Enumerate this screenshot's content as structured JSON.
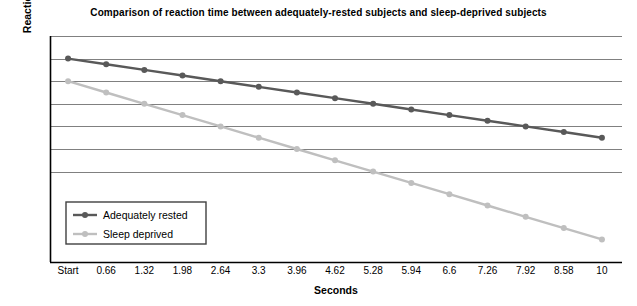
{
  "chart_data": {
    "type": "line",
    "title": "Comparison of reaction time between adequately-rested subjects and sleep-deprived subjects",
    "xlabel": "Seconds",
    "ylabel": "Reaction time   < Slower   Faster >",
    "categories": [
      "Start",
      "0.66",
      "1.32",
      "1.98",
      "2.64",
      "3.3",
      "3.96",
      "4.62",
      "5.28",
      "5.94",
      "6.6",
      "7.26",
      "7.92",
      "8.58",
      "10"
    ],
    "series": [
      {
        "name": "Adequately rested",
        "color": "#595959",
        "values": [
          10.0,
          9.75,
          9.5,
          9.25,
          9.0,
          8.75,
          8.5,
          8.25,
          8.0,
          7.75,
          7.5,
          7.25,
          7.0,
          6.75,
          6.5
        ]
      },
      {
        "name": "Sleep deprived",
        "color": "#bfbfbf",
        "values": [
          9.0,
          8.5,
          8.0,
          7.5,
          7.0,
          6.5,
          6.0,
          5.5,
          5.0,
          4.5,
          4.0,
          3.5,
          3.0,
          2.5,
          2.0
        ]
      }
    ],
    "ylim": [
      1.0,
      11.0
    ],
    "y_gridlines": [
      11.0,
      10.0,
      9.0,
      8.0,
      7.0,
      6.0,
      5.0
    ],
    "y_tick_labels_shown": false,
    "grid": true,
    "legend_position": "bottom-left-inside",
    "axis_color": "#000000",
    "gridline_color": "#808080",
    "marker": "circle"
  }
}
